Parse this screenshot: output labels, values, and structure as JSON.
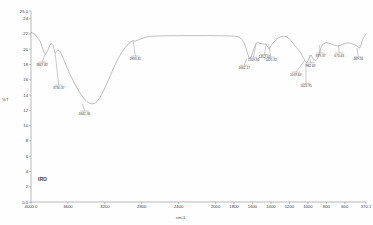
{
  "chart_data": {
    "type": "line",
    "title": "",
    "subtitle": "",
    "xlabel": "cm-1",
    "ylabel": "%T",
    "series_name": "IRO",
    "xlim": [
      4000.0,
      370.1
    ],
    "ylim": [
      0.0,
      25.0
    ],
    "x_inverted": true,
    "grid": false,
    "legend_position": "none",
    "x_ticks": [
      4000.0,
      3600,
      3200,
      2800,
      2400,
      2000,
      1800,
      1600,
      1400,
      1200,
      1000,
      800,
      600,
      370.1
    ],
    "x_tick_labels": [
      "4000.0",
      "3600",
      "3200",
      "2800",
      "2400",
      "2000",
      "1800",
      "1600",
      "1400",
      "1200",
      "1000",
      "800",
      "600",
      "370.1"
    ],
    "y_ticks": [
      0.0,
      2,
      4,
      6,
      8,
      10,
      12,
      14,
      16,
      18,
      20,
      22,
      24,
      25.0
    ],
    "y_tick_labels": [
      "0.0",
      "2",
      "4",
      "6",
      "8",
      "10",
      "12",
      "14",
      "16",
      "18",
      "20",
      "22",
      "24",
      "25.0"
    ],
    "x": [
      4000,
      3960,
      3930,
      3900,
      3880,
      3862,
      3845,
      3830,
      3812,
      3795,
      3780,
      3762,
      3750,
      3738,
      3725,
      3710,
      3695,
      3680,
      3660,
      3640,
      3610,
      3580,
      3540,
      3500,
      3460,
      3430,
      3400,
      3370,
      3340,
      3310,
      3280,
      3250,
      3220,
      3190,
      3160,
      3120,
      3080,
      3040,
      3000,
      2960,
      2920,
      2893,
      2870,
      2840,
      2800,
      2760,
      2720,
      2680,
      2640,
      2600,
      2500,
      2400,
      2300,
      2200,
      2100,
      2000,
      1950,
      1900,
      1860,
      1820,
      1780,
      1750,
      1730,
      1710,
      1690,
      1670,
      1662,
      1650,
      1640,
      1628,
      1615,
      1600,
      1585,
      1570,
      1555,
      1545,
      1535,
      1520,
      1500,
      1480,
      1460,
      1445,
      1430,
      1420,
      1410,
      1400,
      1385,
      1370,
      1350,
      1330,
      1310,
      1290,
      1270,
      1250,
      1230,
      1210,
      1190,
      1170,
      1150,
      1130,
      1110,
      1090,
      1070,
      1060,
      1050,
      1040,
      1033,
      1024,
      1015,
      1005,
      995,
      985,
      975,
      965,
      955,
      945,
      930,
      915,
      900,
      885,
      875,
      865,
      855,
      845,
      830,
      815,
      800,
      780,
      760,
      740,
      720,
      700,
      680,
      660,
      640,
      620,
      600,
      580,
      560,
      540,
      520,
      500,
      480,
      469,
      460,
      450,
      440,
      430,
      420,
      410,
      400,
      390,
      380,
      370.1
    ],
    "y": [
      22.2,
      22.0,
      21.5,
      21.0,
      20.3,
      19.7,
      19.3,
      19.55,
      20.0,
      20.5,
      20.8,
      20.5,
      20.0,
      19.45,
      19.7,
      19.9,
      19.85,
      19.6,
      19.1,
      18.5,
      17.6,
      16.8,
      15.8,
      14.9,
      14.1,
      13.6,
      13.2,
      12.95,
      12.85,
      12.9,
      13.2,
      13.7,
      14.4,
      15.2,
      16.0,
      17.1,
      18.2,
      19.1,
      19.9,
      20.5,
      20.95,
      21.12,
      21.05,
      21.2,
      21.4,
      21.55,
      21.65,
      21.7,
      21.72,
      21.74,
      21.76,
      21.77,
      21.78,
      21.78,
      21.78,
      21.77,
      21.76,
      21.75,
      21.74,
      21.72,
      21.68,
      21.6,
      21.45,
      21.2,
      20.8,
      20.2,
      19.8,
      19.3,
      18.95,
      18.75,
      19.0,
      19.5,
      20.1,
      20.5,
      20.8,
      20.9,
      20.85,
      20.75,
      20.7,
      20.68,
      20.66,
      20.5,
      20.2,
      20.0,
      20.15,
      20.45,
      20.7,
      20.9,
      21.2,
      21.4,
      21.55,
      21.65,
      21.7,
      21.68,
      21.6,
      21.45,
      21.2,
      20.9,
      20.6,
      20.3,
      20.0,
      19.7,
      19.4,
      19.1,
      18.9,
      18.7,
      18.5,
      18.35,
      18.2,
      18.35,
      18.6,
      18.9,
      19.1,
      19.25,
      19.0,
      18.8,
      18.6,
      18.5,
      18.7,
      19.1,
      19.6,
      20.0,
      20.3,
      20.55,
      20.7,
      20.8,
      20.85,
      20.82,
      20.75,
      20.65,
      20.55,
      20.5,
      20.45,
      20.48,
      20.55,
      20.65,
      20.72,
      20.78,
      20.8,
      20.78,
      20.7,
      20.6,
      20.5,
      20.4,
      20.3,
      20.2,
      20.15,
      20.3,
      20.7,
      21.1,
      21.4,
      21.65,
      21.85,
      22.0,
      22.1,
      22.2
    ],
    "annotations": [
      {
        "label": "3847.82",
        "x": 3847.82,
        "y": 19.3,
        "label_x": 3880,
        "label_y": 18.3
      },
      {
        "label": "3730.37",
        "x": 3738,
        "y": 19.45,
        "label_x": 3700,
        "label_y": 15.3
      },
      {
        "label": "3442.36",
        "x": 3442,
        "y": 12.85,
        "label_x": 3420,
        "label_y": 11.9
      },
      {
        "label": "2893.31",
        "x": 2893,
        "y": 21.12,
        "label_x": 2870,
        "label_y": 19.1
      },
      {
        "label": "1662.17",
        "x": 1662,
        "y": 18.75,
        "label_x": 1690,
        "label_y": 17.9
      },
      {
        "label": "1559.36",
        "x": 1559,
        "y": 20.9,
        "label_x": 1590,
        "label_y": 18.95
      },
      {
        "label": "1452.01",
        "x": 1452,
        "y": 20.68,
        "label_x": 1470,
        "label_y": 19.3
      },
      {
        "label": "1425.32",
        "x": 1425,
        "y": 20.66,
        "label_x": 1400,
        "label_y": 18.95
      },
      {
        "label": "1037.63",
        "x": 1037,
        "y": 18.5,
        "label_x": 1130,
        "label_y": 17.0
      },
      {
        "label": "1022.95",
        "x": 1022,
        "y": 18.2,
        "label_x": 1020,
        "label_y": 15.5
      },
      {
        "label": "982.69",
        "x": 982,
        "y": 19.25,
        "label_x": 970,
        "label_y": 18.2
      },
      {
        "label": "879.37",
        "x": 879,
        "y": 20.55,
        "label_x": 862,
        "label_y": 19.5
      },
      {
        "label": "670.43",
        "x": 670,
        "y": 20.45,
        "label_x": 660,
        "label_y": 19.5
      },
      {
        "label": "469.56",
        "x": 469,
        "y": 20.15,
        "label_x": 452,
        "label_y": 19.0
      }
    ],
    "colors": {
      "line": "#8c8c8c",
      "axis": "#8a8a8a",
      "text": "#3a3a3a",
      "background": "#fefefe"
    }
  }
}
